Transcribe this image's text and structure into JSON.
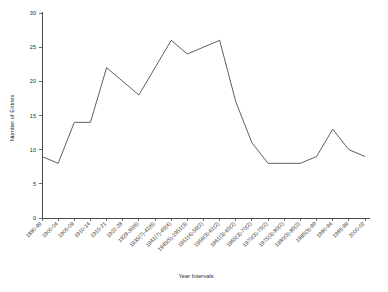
{
  "chart_data": {
    "type": "line",
    "title": "",
    "xlabel": "Year Intervals",
    "ylabel": "Number of Entries",
    "ylim": [
      0,
      30
    ],
    "yticks": [
      0,
      5,
      10,
      15,
      20,
      25,
      30
    ],
    "grid": false,
    "legend": false,
    "line_color": "#4c4c52",
    "categories": [
      "1890-99",
      "1900-04",
      "1905-09",
      "1910-14",
      "1915-21",
      "1922-28",
      "1929-35(6)",
      "1935(7)-41(6)",
      "1941(7)-45(4)",
      "1945(5)-1951(3)",
      "1951(4)-56(2)",
      "1956(3)-61(2)",
      "1961(3)-65(2)",
      "1965(3)-70(2)",
      "1970(3)-75(2)",
      "1975(3)-80(2)",
      "1980(3)-85(2)",
      "1985(3)-89",
      "1990-94",
      "1995-99",
      "2000-02"
    ],
    "values": [
      9,
      8,
      14,
      14,
      22,
      20,
      18,
      22,
      26,
      24,
      25,
      26,
      17,
      11,
      8,
      8,
      8,
      9,
      13,
      10,
      9
    ]
  },
  "axes": {
    "y_title": "Number of Entries",
    "x_title": "Year Intervals"
  }
}
